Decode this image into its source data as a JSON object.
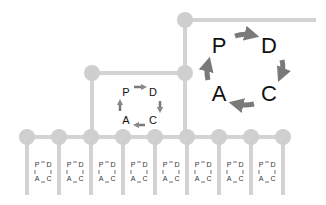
{
  "diagram": {
    "colors": {
      "line": "#d3d3d3",
      "node": "#cfcfcf",
      "arrow": "#7a7a7a",
      "text": "#111111"
    },
    "top_cycle": {
      "P": "P",
      "D": "D",
      "C": "C",
      "A": "A"
    },
    "mid_cycle": {
      "P": "P",
      "D": "D",
      "C": "C",
      "A": "A"
    },
    "small_cycle": {
      "P": "P",
      "D": "D",
      "C": "C",
      "A": "A"
    },
    "bottom_node_count": 9,
    "small_cycle_count": 8
  }
}
